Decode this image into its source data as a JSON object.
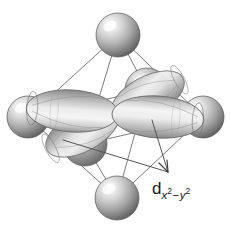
{
  "figure": {
    "background_color": "#ffffff",
    "width": 230,
    "height": 229,
    "label": {
      "base": "d",
      "subscript_x": "x",
      "subscript_x_exponent": "2",
      "subscript_operator": "−",
      "subscript_y": "y",
      "subscript_y_exponent": "2",
      "full_text": "d x2 − y2",
      "color": "#1a1a1a",
      "x": 152,
      "y": 180
    },
    "colors": {
      "sphere_light": "#f2f2f2",
      "sphere_mid": "#b4b4b4",
      "sphere_dark": "#6e6e6e",
      "sphere_edge": "#4a4a4a",
      "lobe_light": "#f0f0f0",
      "lobe_mid": "#c4c4c4",
      "lobe_dark": "#8a8a8a",
      "lobe_outline": "#6a6a6a",
      "wireframe": "#7d7d7d",
      "leader_line": "#555555"
    },
    "geometry": {
      "center": [
        115,
        114
      ],
      "sphere_radius": 21,
      "sphere_count": 6,
      "lobe_count": 4
    },
    "spheres": [
      {
        "name": "ligand-top",
        "cx": 118,
        "cy": 35,
        "r": 22
      },
      {
        "name": "ligand-left",
        "cx": 28,
        "cy": 117,
        "r": 21
      },
      {
        "name": "ligand-right",
        "cx": 203,
        "cy": 117,
        "r": 21
      },
      {
        "name": "ligand-bottom",
        "cx": 117,
        "cy": 198,
        "r": 22
      },
      {
        "name": "ligand-back",
        "cx": 147,
        "cy": 90,
        "r": 22
      },
      {
        "name": "ligand-front",
        "cx": 85,
        "cy": 144,
        "r": 22
      }
    ],
    "lobes": [
      {
        "name": "lobe-left",
        "direction": "west"
      },
      {
        "name": "lobe-right",
        "direction": "east"
      },
      {
        "name": "lobe-back",
        "direction": "northeast"
      },
      {
        "name": "lobe-front",
        "direction": "southwest"
      }
    ],
    "wireframe_edges": 12,
    "leader_lines": 2
  }
}
